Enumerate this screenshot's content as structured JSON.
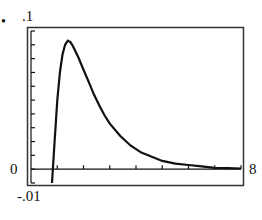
{
  "labels": {
    "ymax": ".1",
    "ymin": "-.01",
    "xmin": "0",
    "xmax": "8",
    "bullet": "•"
  },
  "chart_data": {
    "type": "line",
    "title": "",
    "xlabel": "",
    "ylabel": "",
    "xlim": [
      0,
      8
    ],
    "ylim": [
      -0.01,
      0.1
    ],
    "x_tick_labels": [
      "0",
      "8"
    ],
    "y_tick_labels": [
      "-.01",
      ".1"
    ],
    "grid": false,
    "legend": null,
    "x": [
      0.8,
      0.9,
      1.0,
      1.1,
      1.2,
      1.3,
      1.4,
      1.5,
      1.6,
      1.8,
      2.0,
      2.2,
      2.4,
      2.6,
      2.8,
      3.0,
      3.4,
      3.8,
      4.2,
      4.6,
      5.0,
      5.5,
      6.0,
      6.5,
      7.0,
      7.5,
      8.0
    ],
    "values": [
      -0.01,
      0.02,
      0.05,
      0.07,
      0.083,
      0.09,
      0.093,
      0.092,
      0.089,
      0.081,
      0.072,
      0.063,
      0.054,
      0.046,
      0.039,
      0.033,
      0.024,
      0.017,
      0.012,
      0.009,
      0.006,
      0.004,
      0.003,
      0.002,
      0.001,
      0.0008,
      0.0005
    ]
  }
}
